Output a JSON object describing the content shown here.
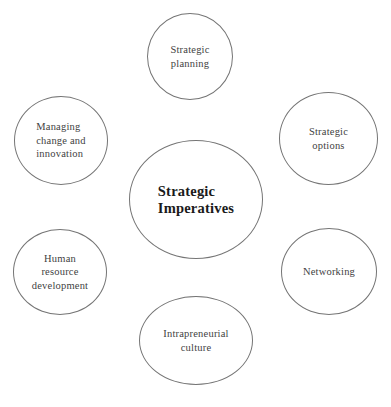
{
  "diagram": {
    "type": "hub-and-spoke",
    "background_color": "#ffffff",
    "circle_stroke_color": "#757575",
    "satellite_text_color": "#3f3f3f",
    "center_text_color": "#1a1a1a",
    "center": {
      "label": "Strategic\nImperatives"
    },
    "nodes": {
      "strategic_planning": {
        "label": "Strategic\nplanning",
        "position": "top"
      },
      "strategic_options": {
        "label": "Strategic\noptions",
        "position": "upper-right"
      },
      "networking": {
        "label": "Networking",
        "position": "lower-right"
      },
      "intrapreneurial_culture": {
        "label": "Intrapreneurial\nculture",
        "position": "bottom"
      },
      "human_resource_development": {
        "label": "Human\nresource\ndevelopment",
        "position": "lower-left"
      },
      "managing_change_and_innovation": {
        "label": "Managing\nchange and\ninnovation",
        "position": "upper-left"
      }
    }
  }
}
